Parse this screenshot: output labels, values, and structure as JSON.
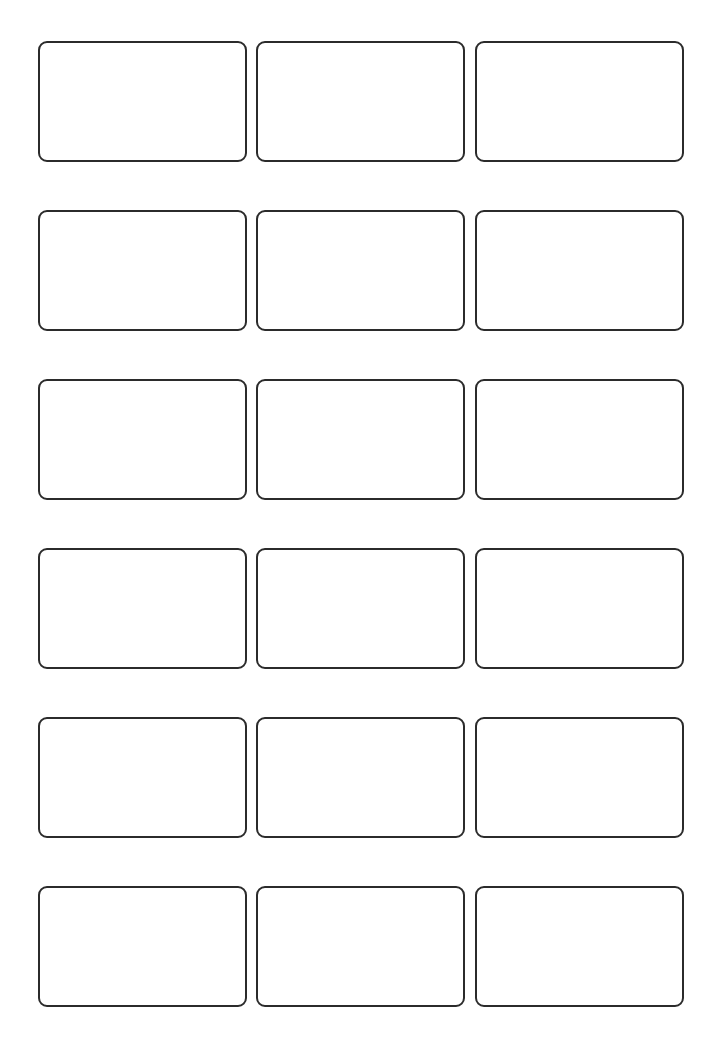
{
  "page": {
    "type": "label-sheet-template",
    "columns": 3,
    "rows": 6,
    "label_count": 18,
    "border_color": "#2b2b2b",
    "background_color": "#ffffff"
  },
  "layout": {
    "col_x": [
      38,
      256,
      475
    ],
    "row_y": [
      41,
      210,
      379,
      548,
      717,
      886
    ],
    "label_width": 209,
    "label_height": 121
  },
  "labels": [
    {
      "row": 1,
      "col": 1,
      "text": ""
    },
    {
      "row": 1,
      "col": 2,
      "text": ""
    },
    {
      "row": 1,
      "col": 3,
      "text": ""
    },
    {
      "row": 2,
      "col": 1,
      "text": ""
    },
    {
      "row": 2,
      "col": 2,
      "text": ""
    },
    {
      "row": 2,
      "col": 3,
      "text": ""
    },
    {
      "row": 3,
      "col": 1,
      "text": ""
    },
    {
      "row": 3,
      "col": 2,
      "text": ""
    },
    {
      "row": 3,
      "col": 3,
      "text": ""
    },
    {
      "row": 4,
      "col": 1,
      "text": ""
    },
    {
      "row": 4,
      "col": 2,
      "text": ""
    },
    {
      "row": 4,
      "col": 3,
      "text": ""
    },
    {
      "row": 5,
      "col": 1,
      "text": ""
    },
    {
      "row": 5,
      "col": 2,
      "text": ""
    },
    {
      "row": 5,
      "col": 3,
      "text": ""
    },
    {
      "row": 6,
      "col": 1,
      "text": ""
    },
    {
      "row": 6,
      "col": 2,
      "text": ""
    },
    {
      "row": 6,
      "col": 3,
      "text": ""
    }
  ]
}
